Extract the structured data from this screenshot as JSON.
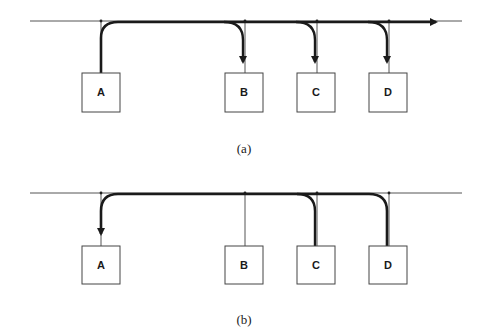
{
  "diagrams": [
    {
      "caption": "(a)",
      "bus": {
        "y": 21,
        "x_start": 30,
        "x_end": 462,
        "color": "#333333"
      },
      "nodes": [
        {
          "label": "A",
          "tap_x": 101,
          "box_x": 82,
          "box_y": 73
        },
        {
          "label": "B",
          "tap_x": 245,
          "box_x": 225,
          "box_y": 73
        },
        {
          "label": "C",
          "tap_x": 317,
          "box_x": 297,
          "box_y": 73
        },
        {
          "label": "D",
          "tap_x": 389,
          "box_x": 369,
          "box_y": 73
        }
      ],
      "signal": {
        "source": "A",
        "destinations": [
          "B",
          "C",
          "D"
        ],
        "continues_right": true
      }
    },
    {
      "caption": "(b)",
      "bus": {
        "y": 193,
        "x_start": 30,
        "x_end": 462,
        "color": "#333333"
      },
      "nodes": [
        {
          "label": "A",
          "tap_x": 101,
          "box_x": 82,
          "box_y": 246
        },
        {
          "label": "B",
          "tap_x": 245,
          "box_x": 225,
          "box_y": 246
        },
        {
          "label": "C",
          "tap_x": 317,
          "box_x": 297,
          "box_y": 246
        },
        {
          "label": "D",
          "tap_x": 389,
          "box_x": 369,
          "box_y": 246
        }
      ],
      "signal": {
        "sources": [
          "C",
          "D"
        ],
        "destination": "A"
      }
    }
  ],
  "style": {
    "line_color": "#1a1a1a",
    "thin_line": "#444444",
    "box_size": 38
  }
}
